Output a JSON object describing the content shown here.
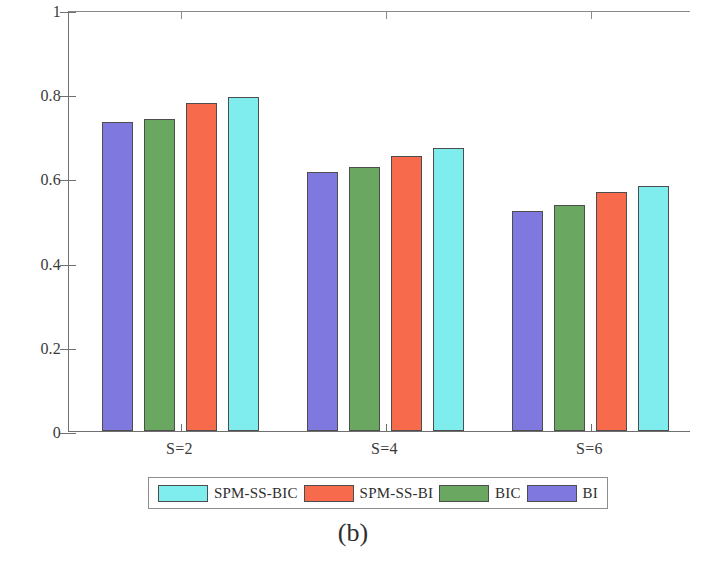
{
  "caption": "(b)",
  "colors": {
    "bi": "#7f78de",
    "bic": "#6aa862",
    "spm_ss_bi": "#f86a4c",
    "spm_ss_bic": "#7feded",
    "axis": "#6f6f6f",
    "edge": "#4d4d4d",
    "text": "#2e2e2e"
  },
  "legend": {
    "entries": [
      {
        "label": "SPM-SS-BIC",
        "color_key": "spm_ss_bic",
        "swatch_name": "legend-swatch-spm-ss-bic"
      },
      {
        "label": "SPM-SS-BI",
        "color_key": "spm_ss_bi",
        "swatch_name": "legend-swatch-spm-ss-bi"
      },
      {
        "label": "BIC",
        "color_key": "bic",
        "swatch_name": "legend-swatch-bic"
      },
      {
        "label": "BI",
        "color_key": "bi",
        "swatch_name": "legend-swatch-bi"
      }
    ]
  },
  "chart_data": {
    "type": "bar",
    "title": "",
    "subtitle": "",
    "xlabel": "",
    "ylabel": "Kappa",
    "categories": [
      "S=2",
      "S=4",
      "S=6"
    ],
    "series": [
      {
        "name": "BI",
        "color": "#7f78de",
        "values": [
          0.735,
          0.615,
          0.523
        ]
      },
      {
        "name": "BIC",
        "color": "#6aa862",
        "values": [
          0.742,
          0.627,
          0.537
        ]
      },
      {
        "name": "SPM-SS-BI",
        "color": "#f86a4c",
        "values": [
          0.778,
          0.653,
          0.567
        ]
      },
      {
        "name": "SPM-SS-BIC",
        "color": "#7feded",
        "values": [
          0.793,
          0.673,
          0.583
        ]
      }
    ],
    "series_draw_order": [
      "BI",
      "BIC",
      "SPM-SS-BI",
      "SPM-SS-BIC"
    ],
    "legend_order": [
      "SPM-SS-BIC",
      "SPM-SS-BI",
      "BIC",
      "BI"
    ],
    "ylim": [
      0,
      1
    ],
    "yticks": [
      0,
      0.2,
      0.4,
      0.6,
      0.8,
      1
    ],
    "ytick_labels": [
      "0",
      "0.2",
      "0.4",
      "0.6",
      "0.8",
      "1"
    ],
    "grid": false,
    "legend_position": "bottom-outside"
  }
}
